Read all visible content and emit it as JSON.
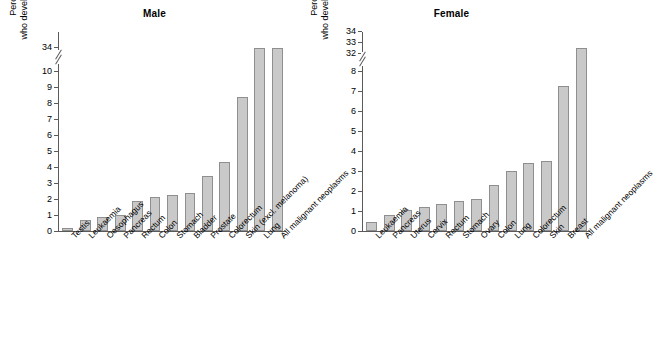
{
  "chart_data": [
    {
      "type": "bar",
      "title": "Male",
      "xlabel": "",
      "ylabel": "Percentage of cohort who develop cancer over lifetime",
      "ylabel_line1": "Percentage of cohort",
      "ylabel_line2": "who develop cancer over lifetime",
      "categories": [
        "Testis",
        "Leukaemia",
        "Oesophagus",
        "Pancreas",
        "Rectum",
        "Colon",
        "Stomach",
        "Bladder",
        "Prostate",
        "Colorectum",
        "Skin (excl. melanoma)",
        "Lung",
        "All malignant neoplasms"
      ],
      "values": [
        0.2,
        0.7,
        0.85,
        1.0,
        1.9,
        2.15,
        2.25,
        2.4,
        3.45,
        4.0,
        8.4,
        33.9,
        33.9
      ],
      "bar_values": [
        0.2,
        0.7,
        0.85,
        1.0,
        1.9,
        2.15,
        2.25,
        2.4,
        3.45,
        4.3,
        8.4,
        33.9,
        33.9
      ],
      "tick_labels": [
        "0",
        "1",
        "2",
        "3",
        "4",
        "5",
        "6",
        "7",
        "8",
        "9",
        "10",
        "34"
      ],
      "axis_break": true,
      "ylim": [
        0,
        34
      ],
      "grid": false,
      "legend": "none"
    },
    {
      "type": "bar",
      "title": "Female",
      "xlabel": "",
      "ylabel": "Percentage of cohort who develop cancer over lifetime",
      "ylabel_line1": "Percentage of cohort",
      "ylabel_line2": "who develop cancer over lifetime",
      "categories": [
        "Leukaemia",
        "Pancreas",
        "Uterus",
        "Cervix",
        "Rectum",
        "Stomach",
        "Ovary",
        "Colon",
        "Lung",
        "Colorectum",
        "Skin",
        "Breast",
        "All malignant neoplasms"
      ],
      "values": [
        0.45,
        0.8,
        1.05,
        1.2,
        1.35,
        1.5,
        1.6,
        2.3,
        3.0,
        3.4,
        3.5,
        7.25,
        32.5
      ],
      "tick_labels": [
        "0",
        "1",
        "2",
        "3",
        "4",
        "5",
        "6",
        "7",
        "8",
        "32",
        "33",
        "34"
      ],
      "axis_break": true,
      "ylim": [
        0,
        34
      ],
      "grid": false,
      "legend": "none"
    }
  ],
  "male": {
    "title": "Male",
    "ylabel_line1": "Percentage of cohort",
    "ylabel_line2": "who develop cancer over lifetime",
    "ticks": [
      {
        "label": "0",
        "y": 0
      },
      {
        "label": "1",
        "y": 16.0
      },
      {
        "label": "2",
        "y": 32.0
      },
      {
        "label": "3",
        "y": 48.0
      },
      {
        "label": "4",
        "y": 64.0
      },
      {
        "label": "5",
        "y": 80.0
      },
      {
        "label": "6",
        "y": 96.0
      },
      {
        "label": "7",
        "y": 112.0
      },
      {
        "label": "8",
        "y": 128.0
      },
      {
        "label": "9",
        "y": 144.0
      },
      {
        "label": "10",
        "y": 160.0
      },
      {
        "label": "34",
        "y": 184.0
      }
    ],
    "bars": [
      {
        "label": "Testis",
        "value": 0.2,
        "h": 3.2
      },
      {
        "label": "Leukaemia",
        "value": 0.7,
        "h": 11.2
      },
      {
        "label": "Oesophagus",
        "value": 0.85,
        "h": 13.6
      },
      {
        "label": "Pancreas",
        "value": 1.0,
        "h": 16.0
      },
      {
        "label": "Rectum",
        "value": 1.9,
        "h": 30.4
      },
      {
        "label": "Colon",
        "value": 2.15,
        "h": 34.4
      },
      {
        "label": "Stomach",
        "value": 2.25,
        "h": 36.0
      },
      {
        "label": "Bladder",
        "value": 2.4,
        "h": 38.4
      },
      {
        "label": "Prostate",
        "value": 3.45,
        "h": 55.2
      },
      {
        "label": "Colorectum",
        "value": 4.3,
        "h": 68.8
      },
      {
        "label": "Skin (excl. melanoma)",
        "value": 8.4,
        "h": 134.4
      },
      {
        "label": "Lung",
        "value": 33.9,
        "h": 183.0
      },
      {
        "label": "All malignant neoplasms",
        "value": 33.9,
        "h": 183.0
      }
    ]
  },
  "female": {
    "title": "Female",
    "ylabel_line1": "Percentage of cohort",
    "ylabel_line2": "who develop cancer over lifetime",
    "ticks": [
      {
        "label": "0",
        "y": 0
      },
      {
        "label": "1",
        "y": 20.0
      },
      {
        "label": "2",
        "y": 40.0
      },
      {
        "label": "3",
        "y": 60.0
      },
      {
        "label": "4",
        "y": 80.0
      },
      {
        "label": "5",
        "y": 100.0
      },
      {
        "label": "6",
        "y": 120.0
      },
      {
        "label": "7",
        "y": 140.0
      },
      {
        "label": "8",
        "y": 160.0
      },
      {
        "label": "32",
        "y": 178.0
      },
      {
        "label": "33",
        "y": 189.0
      },
      {
        "label": "34",
        "y": 200.0
      }
    ],
    "bars": [
      {
        "label": "Leukaemia",
        "value": 0.45,
        "h": 9.0
      },
      {
        "label": "Pancreas",
        "value": 0.8,
        "h": 16.0
      },
      {
        "label": "Uterus",
        "value": 1.05,
        "h": 21.0
      },
      {
        "label": "Cervix",
        "value": 1.2,
        "h": 24.0
      },
      {
        "label": "Rectum",
        "value": 1.35,
        "h": 27.0
      },
      {
        "label": "Stomach",
        "value": 1.5,
        "h": 30.0
      },
      {
        "label": "Ovary",
        "value": 1.6,
        "h": 32.0
      },
      {
        "label": "Colon",
        "value": 2.3,
        "h": 46.0
      },
      {
        "label": "Lung",
        "value": 3.0,
        "h": 60.0
      },
      {
        "label": "Colorectum",
        "value": 3.4,
        "h": 68.0
      },
      {
        "label": "Skin",
        "value": 3.5,
        "h": 70.0
      },
      {
        "label": "Breast",
        "value": 7.25,
        "h": 145.0
      },
      {
        "label": "All malignant neoplasms",
        "value": 32.5,
        "h": 183.5
      }
    ]
  },
  "style": {
    "bar_fill": "#c9c9c9",
    "bar_stroke": "#8f8f8f",
    "axis_color": "#5a5a5a",
    "text_color": "#000000",
    "background": "#ffffff"
  }
}
